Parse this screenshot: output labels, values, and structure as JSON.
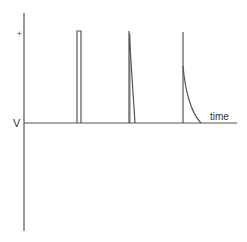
{
  "diagram": {
    "type": "waveform",
    "y_axis_label": "V",
    "y_axis_tick_label": "+",
    "x_axis_label": "time",
    "line_color": "#555555",
    "pulses": [
      {
        "shape": "rectangular",
        "description": "square pulse"
      },
      {
        "shape": "linear-decay",
        "description": "sharp rise, linear fall"
      },
      {
        "shape": "exponential-decay",
        "description": "sharp rise, exponential fall"
      }
    ]
  }
}
